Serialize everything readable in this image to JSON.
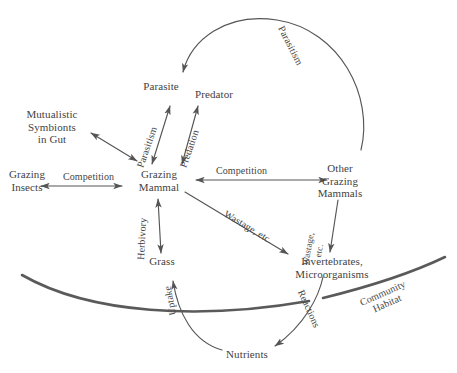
{
  "diagram": {
    "background_color": "#ffffff",
    "line_color": "#555555",
    "habitat_arc_color": "#5a5a5a",
    "text_color": "#3f3f3f",
    "nodes": [
      {
        "id": "parasite",
        "name": "parasite",
        "lines": [
          "Parasite"
        ]
      },
      {
        "id": "predator",
        "name": "predator",
        "lines": [
          "Predator"
        ]
      },
      {
        "id": "symbionts",
        "name": "mutualistic-symbionts-in-gut",
        "lines": [
          "Mutualistic",
          "Symbionts",
          "in Gut"
        ]
      },
      {
        "id": "grazing_insects",
        "name": "grazing-insects",
        "lines": [
          "Grazing",
          "Insects"
        ]
      },
      {
        "id": "grazing_mammal",
        "name": "grazing-mammal",
        "lines": [
          "Grazing",
          "Mammal"
        ]
      },
      {
        "id": "other_mammals",
        "name": "other-grazing-mammals",
        "lines": [
          "Other",
          "Grazing",
          "Mammals"
        ]
      },
      {
        "id": "grass",
        "name": "grass",
        "lines": [
          "Grass"
        ]
      },
      {
        "id": "invertebrates",
        "name": "invertebrates-microorganisms",
        "lines": [
          "Invertebrates,",
          "Microorganisms"
        ]
      },
      {
        "id": "nutrients",
        "name": "nutrients",
        "lines": [
          "Nutrients"
        ]
      }
    ],
    "edge_labels": [
      {
        "id": "parasitism_arc",
        "name": "parasitism-arc-label",
        "lines": [
          "Parasitism"
        ]
      },
      {
        "id": "parasitism_mammal",
        "name": "parasitism-label",
        "lines": [
          "Parasitism"
        ]
      },
      {
        "id": "predation",
        "name": "predation-label",
        "lines": [
          "Predation"
        ]
      },
      {
        "id": "competition_left",
        "name": "competition-left-label",
        "lines": [
          "Competition"
        ]
      },
      {
        "id": "competition_right",
        "name": "competition-right-label",
        "lines": [
          "Competition"
        ]
      },
      {
        "id": "herbivory",
        "name": "herbivory-label",
        "lines": [
          "Herbivory"
        ]
      },
      {
        "id": "wastage_diag",
        "name": "wastage-diagonal-label",
        "lines": [
          "Wastage, etc."
        ]
      },
      {
        "id": "wastage_vert",
        "name": "wastage-vertical-label",
        "lines": [
          "Wastage,",
          "etc."
        ]
      },
      {
        "id": "uptake",
        "name": "uptake-label",
        "lines": [
          "Uptake"
        ]
      },
      {
        "id": "reactions",
        "name": "reactions-label",
        "lines": [
          "Reactions"
        ]
      },
      {
        "id": "community_habitat",
        "name": "community-habitat-label",
        "lines": [
          "Community",
          "Habitat"
        ]
      }
    ],
    "relationships": [
      {
        "from": "other_mammals",
        "to": "parasite",
        "label": "Parasitism",
        "arrow": "single"
      },
      {
        "from": "grazing_mammal",
        "to": "parasite",
        "label": "Parasitism",
        "arrow": "double"
      },
      {
        "from": "grazing_mammal",
        "to": "predator",
        "label": "Predation",
        "arrow": "double"
      },
      {
        "from": "grazing_mammal",
        "to": "symbionts",
        "label": "",
        "arrow": "double"
      },
      {
        "from": "grazing_insects",
        "to": "grazing_mammal",
        "label": "Competition",
        "arrow": "double"
      },
      {
        "from": "grazing_mammal",
        "to": "other_mammals",
        "label": "Competition",
        "arrow": "double"
      },
      {
        "from": "grazing_mammal",
        "to": "grass",
        "label": "Herbivory",
        "arrow": "double"
      },
      {
        "from": "grazing_mammal",
        "to": "invertebrates",
        "label": "Wastage, etc.",
        "arrow": "single"
      },
      {
        "from": "other_mammals",
        "to": "invertebrates",
        "label": "Wastage, etc.",
        "arrow": "single"
      },
      {
        "from": "invertebrates",
        "to": "nutrients",
        "label": "Reactions",
        "arrow": "single"
      },
      {
        "from": "nutrients",
        "to": "grass",
        "label": "Uptake",
        "arrow": "single"
      }
    ]
  }
}
